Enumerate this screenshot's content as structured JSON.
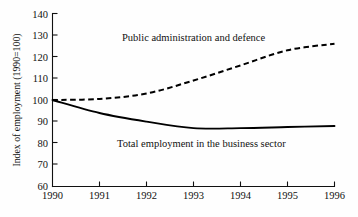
{
  "chart_data": {
    "type": "line",
    "title": "",
    "subtitle": "",
    "xlabel": "",
    "ylabel": "Index of employment (1990=100)",
    "x": [
      1990,
      1991,
      1992,
      1993,
      1994,
      1995,
      1996
    ],
    "categories": [
      "1990",
      "1991",
      "1992",
      "1993",
      "1994",
      "1995",
      "1996"
    ],
    "xlim": [
      1990,
      1996
    ],
    "ylim": [
      60,
      140
    ],
    "yticks": [
      60,
      70,
      80,
      90,
      100,
      110,
      120,
      130,
      140
    ],
    "ytick_labels": [
      "60",
      "70",
      "80",
      "90",
      "100",
      "110",
      "120",
      "130",
      "140"
    ],
    "xticks": [
      1990,
      1991,
      1992,
      1993,
      1994,
      1995,
      1996
    ],
    "xtick_labels": [
      "1990",
      "1991",
      "1992",
      "1993",
      "1994",
      "1995",
      "1996"
    ],
    "grid": false,
    "legend_position": "inline-annotations",
    "series": [
      {
        "name": "Public administration and defence",
        "style": "dashed",
        "color": "#000000",
        "label_text": "Public administration and defence",
        "values": [
          100,
          100.5,
          103,
          109,
          116,
          123,
          126
        ]
      },
      {
        "name": "Total employment in the business sector",
        "style": "solid",
        "color": "#000000",
        "label_text": "Total employment in the business sector",
        "values": [
          100,
          94,
          90,
          87,
          87,
          87.5,
          88
        ]
      }
    ],
    "annotations": [
      {
        "id": "label-public-admin",
        "text": "Public administration and defence",
        "x_px": 122,
        "y_px": 41
      },
      {
        "id": "label-business-sector",
        "text": "Total employment in the business sector",
        "x_px": 117,
        "y_px": 147
      }
    ]
  }
}
